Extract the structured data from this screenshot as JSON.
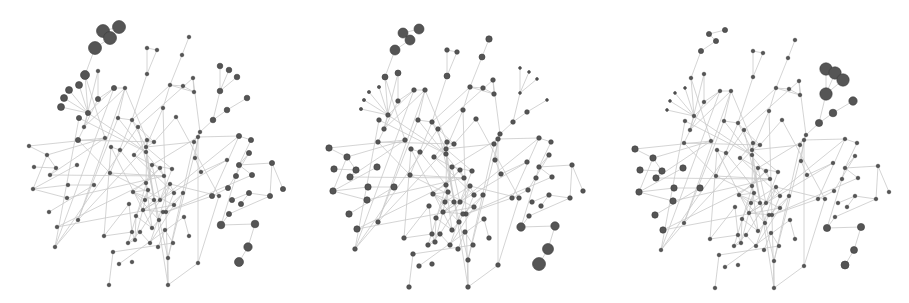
{
  "figure": {
    "title": "",
    "colors": {
      "node": "#555555",
      "node_outline": "#3d3d3d",
      "edge": "#c9c9c9",
      "background": "#ffffff"
    }
  },
  "panels": [
    {
      "name": "graph-left",
      "label": "",
      "emphasis": "top-left cluster and right-side chain nodes large"
    },
    {
      "name": "graph-middle",
      "label": "",
      "emphasis": "most nodes medium, bottom-right chain large"
    },
    {
      "name": "graph-right",
      "label": "",
      "emphasis": "top-right cluster large, left nodes medium"
    }
  ]
}
